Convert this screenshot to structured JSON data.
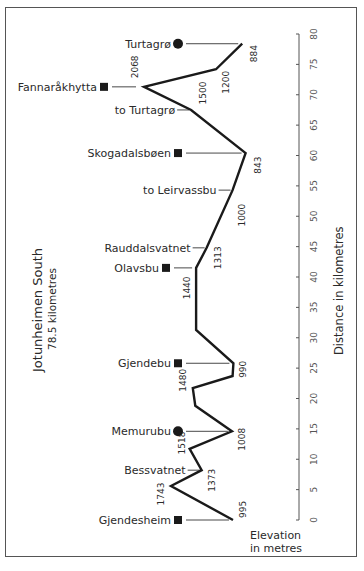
{
  "chart_data": {
    "type": "line",
    "orientation": "vertical-distance-axis",
    "title": "Jotunheimen South",
    "subtitle": "78.5  kilometres",
    "xlabel": "Elevation in metres",
    "xlabel_lines": [
      "Elevation",
      "in metres"
    ],
    "ylabel": "Distance in kilometres",
    "ylim": [
      0,
      80
    ],
    "yticks": [
      0,
      5,
      10,
      15,
      20,
      25,
      30,
      35,
      40,
      45,
      50,
      55,
      60,
      65,
      70,
      75,
      80
    ],
    "grid": false,
    "profile": [
      {
        "km": 0,
        "elev": 995,
        "label": "995"
      },
      {
        "km": 5.6,
        "elev": 1743,
        "label": "1743"
      },
      {
        "km": 8.2,
        "elev": 1373,
        "label": "1373"
      },
      {
        "km": 11.7,
        "elev": 1518,
        "label": "1518"
      },
      {
        "km": 14.6,
        "elev": 1008,
        "label": "1008"
      },
      {
        "km": 18.8,
        "elev": 1450,
        "label": ""
      },
      {
        "km": 21.7,
        "elev": 1480,
        "label": "1480"
      },
      {
        "km": 23.7,
        "elev": 1000,
        "label": ""
      },
      {
        "km": 25.8,
        "elev": 990,
        "label": "990"
      },
      {
        "km": 31.3,
        "elev": 1440,
        "label": ""
      },
      {
        "km": 41.5,
        "elev": 1440,
        "label": "1440"
      },
      {
        "km": 44.8,
        "elev": 1313,
        "label": "1313"
      },
      {
        "km": 54.3,
        "elev": 1000,
        "label": "1000"
      },
      {
        "km": 60.4,
        "elev": 843,
        "label": "843"
      },
      {
        "km": 67.5,
        "elev": 1500,
        "label": "1500"
      },
      {
        "km": 71.3,
        "elev": 2068,
        "label": "2068"
      },
      {
        "km": 74.2,
        "elev": 1200,
        "label": "1200"
      },
      {
        "km": 78.4,
        "elev": 884,
        "label": "884"
      }
    ],
    "places": [
      {
        "name": "Gjendesheim",
        "km": 0,
        "marker": "square"
      },
      {
        "name": "Bessvatnet",
        "km": 8.2,
        "marker": "none"
      },
      {
        "name": "Memurubu",
        "km": 14.6,
        "marker": "circle"
      },
      {
        "name": "Gjendebu",
        "km": 25.8,
        "marker": "square"
      },
      {
        "name": "Olavsbu",
        "km": 41.5,
        "marker": "square"
      },
      {
        "name": "Rauddalsvatnet",
        "km": 44.8,
        "marker": "none"
      },
      {
        "name": "to Leirvassbu",
        "km": 54.3,
        "marker": "none"
      },
      {
        "name": "Skogadalsbøen",
        "km": 60.4,
        "marker": "square"
      },
      {
        "name": "to Turtagrø",
        "km": 67.5,
        "marker": "none"
      },
      {
        "name": "Fannaråkhytta",
        "km": 71.3,
        "marker": "square"
      },
      {
        "name": "Turtagrø",
        "km": 78.4,
        "marker": "circle"
      }
    ],
    "colors": {
      "line": "#1a1a1a",
      "text": "#2a2a2a",
      "axis": "#555555",
      "frame": "#555555"
    }
  }
}
